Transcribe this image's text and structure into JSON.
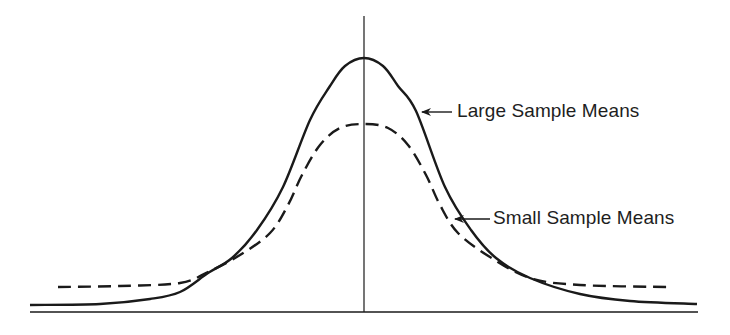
{
  "chart_data": {
    "type": "line",
    "title": "",
    "xlabel": "",
    "ylabel": "",
    "grid": false,
    "legend_position": "inline-annotations",
    "axes": {
      "baseline": {
        "x1": 30,
        "x2": 698,
        "y": 312
      },
      "center_line": {
        "x": 364,
        "y1": 16,
        "y2": 312
      }
    },
    "series": [
      {
        "name": "Large Sample Means",
        "style": "solid",
        "color": "#1a1a1a",
        "points": [
          [
            30,
            305
          ],
          [
            100,
            304
          ],
          [
            150,
            299
          ],
          [
            180,
            292
          ],
          [
            208,
            273
          ],
          [
            232,
            258
          ],
          [
            257,
            230
          ],
          [
            283,
            187
          ],
          [
            310,
            120
          ],
          [
            330,
            86
          ],
          [
            345,
            66
          ],
          [
            364,
            58
          ],
          [
            383,
            66
          ],
          [
            398,
            86
          ],
          [
            416,
            111
          ],
          [
            445,
            187
          ],
          [
            471,
            230
          ],
          [
            496,
            258
          ],
          [
            530,
            278
          ],
          [
            580,
            294
          ],
          [
            630,
            301
          ],
          [
            697,
            304
          ]
        ]
      },
      {
        "name": "Small Sample Means",
        "style": "dashed",
        "color": "#1a1a1a",
        "points": [
          [
            58,
            287
          ],
          [
            120,
            286
          ],
          [
            180,
            283
          ],
          [
            208,
            272
          ],
          [
            240,
            255
          ],
          [
            270,
            233
          ],
          [
            288,
            205
          ],
          [
            302,
            175
          ],
          [
            320,
            145
          ],
          [
            340,
            128
          ],
          [
            364,
            124
          ],
          [
            388,
            128
          ],
          [
            408,
            145
          ],
          [
            426,
            175
          ],
          [
            440,
            205
          ],
          [
            458,
            233
          ],
          [
            490,
            257
          ],
          [
            530,
            278
          ],
          [
            580,
            285
          ],
          [
            670,
            287
          ]
        ]
      }
    ],
    "annotations": [
      {
        "text": "Large Sample Means",
        "arrow_from": [
          452,
          112
        ],
        "arrow_to": [
          422,
          112
        ],
        "text_x": 457,
        "text_y": 101
      },
      {
        "text": "Small Sample Means",
        "arrow_from": [
          490,
          219
        ],
        "arrow_to": [
          455,
          219
        ],
        "text_x": 493,
        "text_y": 208
      }
    ]
  },
  "labels": {
    "large": "Large Sample Means",
    "small": "Small Sample Means"
  }
}
